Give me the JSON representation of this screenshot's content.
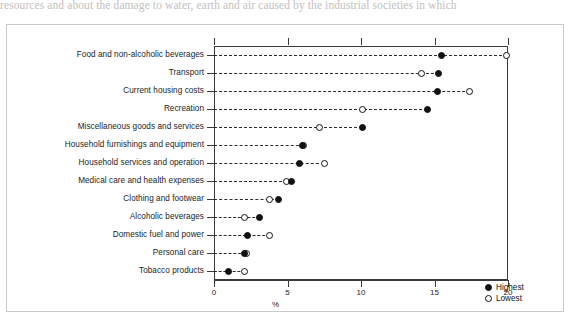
{
  "page": {
    "top_text": "resources and about the damage to water, earth and air caused by the industrial societies in which"
  },
  "legend": {
    "position": "bottom-right",
    "entries": [
      {
        "key": "highest",
        "label": "Highest",
        "marker": "filled-circle-icon"
      },
      {
        "key": "lowest",
        "label": "Lowest",
        "marker": "open-circle-icon"
      }
    ]
  },
  "chart_data": {
    "type": "scatter",
    "title": "",
    "subtitle": "",
    "xlabel": "%",
    "ylabel": "",
    "xlim": [
      0,
      20
    ],
    "xticks": [
      0,
      5,
      10,
      15,
      20
    ],
    "xticklabels": [
      "0",
      "5",
      "10",
      "15",
      "20"
    ],
    "grid": "dashed-horizontal-connector",
    "categories": [
      "Food and non-alcoholic beverages",
      "Transport",
      "Current housing costs",
      "Recreation",
      "Miscellaneous goods and services",
      "Household furnishings and equipment",
      "Household services and operation",
      "Medical care and health expenses",
      "Clothing and footwear",
      "Alcoholic beverages",
      "Domestic fuel and power",
      "Personal care",
      "Tobacco products"
    ],
    "series": [
      {
        "name": "Highest",
        "marker": "filled-circle",
        "color": "#111111",
        "values": [
          15.5,
          15.3,
          15.2,
          14.5,
          10.1,
          6.0,
          5.8,
          5.3,
          4.4,
          3.1,
          2.3,
          2.1,
          1.0
        ]
      },
      {
        "name": "Lowest",
        "marker": "open-circle",
        "color": "#ffffff",
        "values": [
          19.9,
          14.1,
          17.4,
          10.1,
          7.2,
          6.1,
          7.5,
          4.9,
          3.8,
          2.1,
          3.8,
          2.2,
          2.1
        ]
      }
    ],
    "colors": {
      "axis": "#3a3a3a",
      "connector": "#2b2b2b",
      "marker_fill": "#111111",
      "marker_open": "#ffffff",
      "frame": "#c9c9c9",
      "background": "#ffffff"
    }
  }
}
